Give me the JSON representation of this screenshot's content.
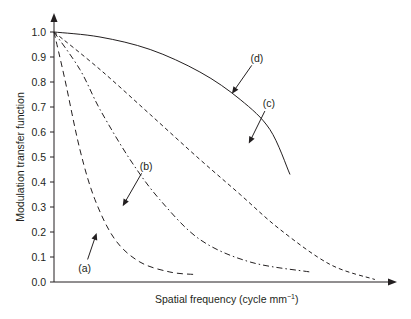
{
  "chart_data": {
    "type": "line",
    "title": "",
    "xlabel": "Spatial frequency (cycle mm",
    "xlabel_superscript": "−1",
    "xlabel_suffix": ")",
    "ylabel": "Modulation transfer function",
    "xlim": [
      0,
      10
    ],
    "ylim": [
      0,
      1.0
    ],
    "grid": false,
    "legend": "none",
    "y_ticks": [
      0.0,
      0.1,
      0.2,
      0.3,
      0.4,
      0.5,
      0.6,
      0.7,
      0.8,
      0.9,
      1.0
    ],
    "y_tick_labels": [
      "0.0",
      "0.1",
      "0.2",
      "0.3",
      "0.4",
      "0.5",
      "0.6",
      "0.7",
      "0.8",
      "0.9",
      "1.0"
    ],
    "x_ticks_shown": false,
    "series": [
      {
        "name": "(a)",
        "style": "dashed-long",
        "x": [
          0,
          0.32,
          0.76,
          1.2,
          1.79,
          2.52,
          3.4,
          4.13
        ],
        "y": [
          1.0,
          0.81,
          0.53,
          0.33,
          0.17,
          0.08,
          0.04,
          0.03
        ],
        "annotation": {
          "text": "(a)",
          "point_x": 1.26,
          "point_y": 0.2,
          "label_x": 0.9,
          "label_y": 0.04
        }
      },
      {
        "name": "(b)",
        "style": "dash-dot",
        "x": [
          0,
          0.76,
          1.35,
          2.23,
          3.1,
          4.28,
          5.75,
          7.51
        ],
        "y": [
          1.0,
          0.85,
          0.69,
          0.49,
          0.33,
          0.17,
          0.08,
          0.04
        ],
        "annotation": {
          "text": "(b)",
          "point_x": 2.0,
          "point_y": 0.3,
          "label_x": 2.7,
          "label_y": 0.45
        }
      },
      {
        "name": "(c)",
        "style": "dashed",
        "x": [
          0,
          1.35,
          2.82,
          4.28,
          5.46,
          6.63,
          8.1,
          9.41
        ],
        "y": [
          1.0,
          0.85,
          0.67,
          0.49,
          0.35,
          0.21,
          0.07,
          0.01
        ],
        "annotation": {
          "text": "(c)",
          "point_x": 5.7,
          "point_y": 0.55,
          "label_x": 6.3,
          "label_y": 0.7
        }
      },
      {
        "name": "(d)",
        "style": "solid",
        "x": [
          0,
          1.35,
          2.82,
          4.28,
          5.46,
          6.33,
          6.92
        ],
        "y": [
          1.0,
          0.98,
          0.93,
          0.84,
          0.73,
          0.61,
          0.43
        ],
        "annotation": {
          "text": "(d)",
          "point_x": 5.2,
          "point_y": 0.75,
          "label_x": 5.95,
          "label_y": 0.88
        }
      }
    ]
  }
}
